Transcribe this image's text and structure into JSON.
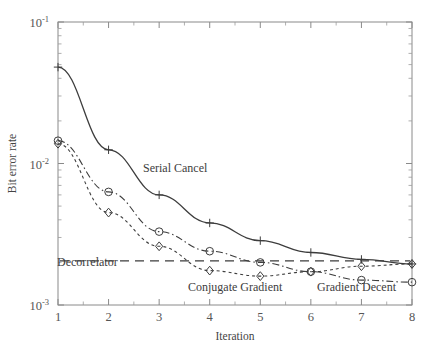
{
  "chart_data": {
    "type": "line",
    "title": "",
    "xlabel": "Iteration",
    "ylabel": "Bit error rate",
    "xlim": [
      1,
      8
    ],
    "ylim": [
      0.001,
      0.1
    ],
    "yscale": "log",
    "xscale": "linear",
    "grid": false,
    "legend_position": "inline-annotations",
    "x": [
      1,
      2,
      3,
      4,
      5,
      6,
      7,
      8
    ],
    "xticklabels": [
      "1",
      "2",
      "3",
      "4",
      "5",
      "6",
      "7",
      "8"
    ],
    "yticklabels": [
      "10-1",
      "10-2",
      "10-3"
    ],
    "ytickvalues": [
      0.1,
      0.01,
      0.001
    ],
    "series": [
      {
        "name": "Serial Cancel",
        "marker": "plus",
        "linestyle": "solid",
        "color": "#3d3d3d",
        "values": [
          0.048,
          0.0125,
          0.006,
          0.0038,
          0.00285,
          0.00235,
          0.0021,
          0.00195
        ]
      },
      {
        "name": "Conjugate Gradient",
        "marker": "diamond",
        "linestyle": "dotted",
        "color": "#3d3d3d",
        "values": [
          0.0138,
          0.0045,
          0.0026,
          0.00175,
          0.0016,
          0.00172,
          0.00188,
          0.00195
        ]
      },
      {
        "name": "Gradient Decent",
        "marker": "circle",
        "linestyle": "dashdot",
        "color": "#3d3d3d",
        "values": [
          0.0145,
          0.0063,
          0.0033,
          0.0024,
          0.002,
          0.00172,
          0.0015,
          0.00145
        ]
      },
      {
        "name": "Decorrelator",
        "marker": "none",
        "linestyle": "dashed",
        "color": "#3d3d3d",
        "constant_value": 0.00205
      }
    ],
    "annotations": [
      {
        "text": "Serial Cancel",
        "x_px": 143,
        "y_px": 172
      },
      {
        "text": "Decorrelator",
        "x_px": 57,
        "y_px": 266
      },
      {
        "text": "Conjugate Gradient",
        "x_px": 188,
        "y_px": 291
      },
      {
        "text": "Gradient Decent",
        "x_px": 317,
        "y_px": 291
      }
    ]
  }
}
